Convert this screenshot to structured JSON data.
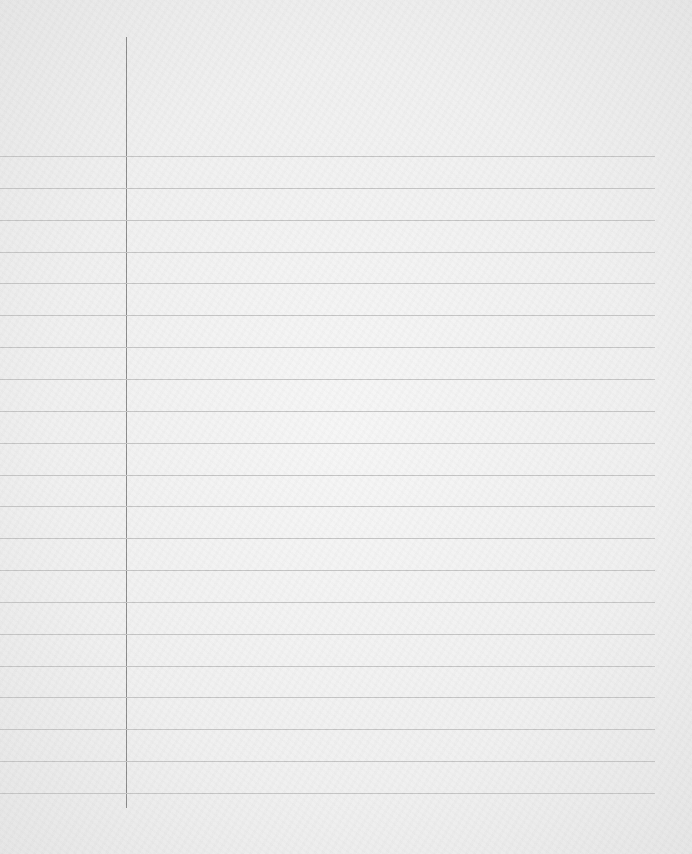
{
  "paper": {
    "type": "lined notebook paper",
    "rule_count": 21,
    "first_rule_y": 156,
    "rule_spacing": 31.85,
    "rule_color": "#c4c4c4",
    "margin_line_color": "#8a8a8a",
    "background_color": "#f0f0f0"
  }
}
